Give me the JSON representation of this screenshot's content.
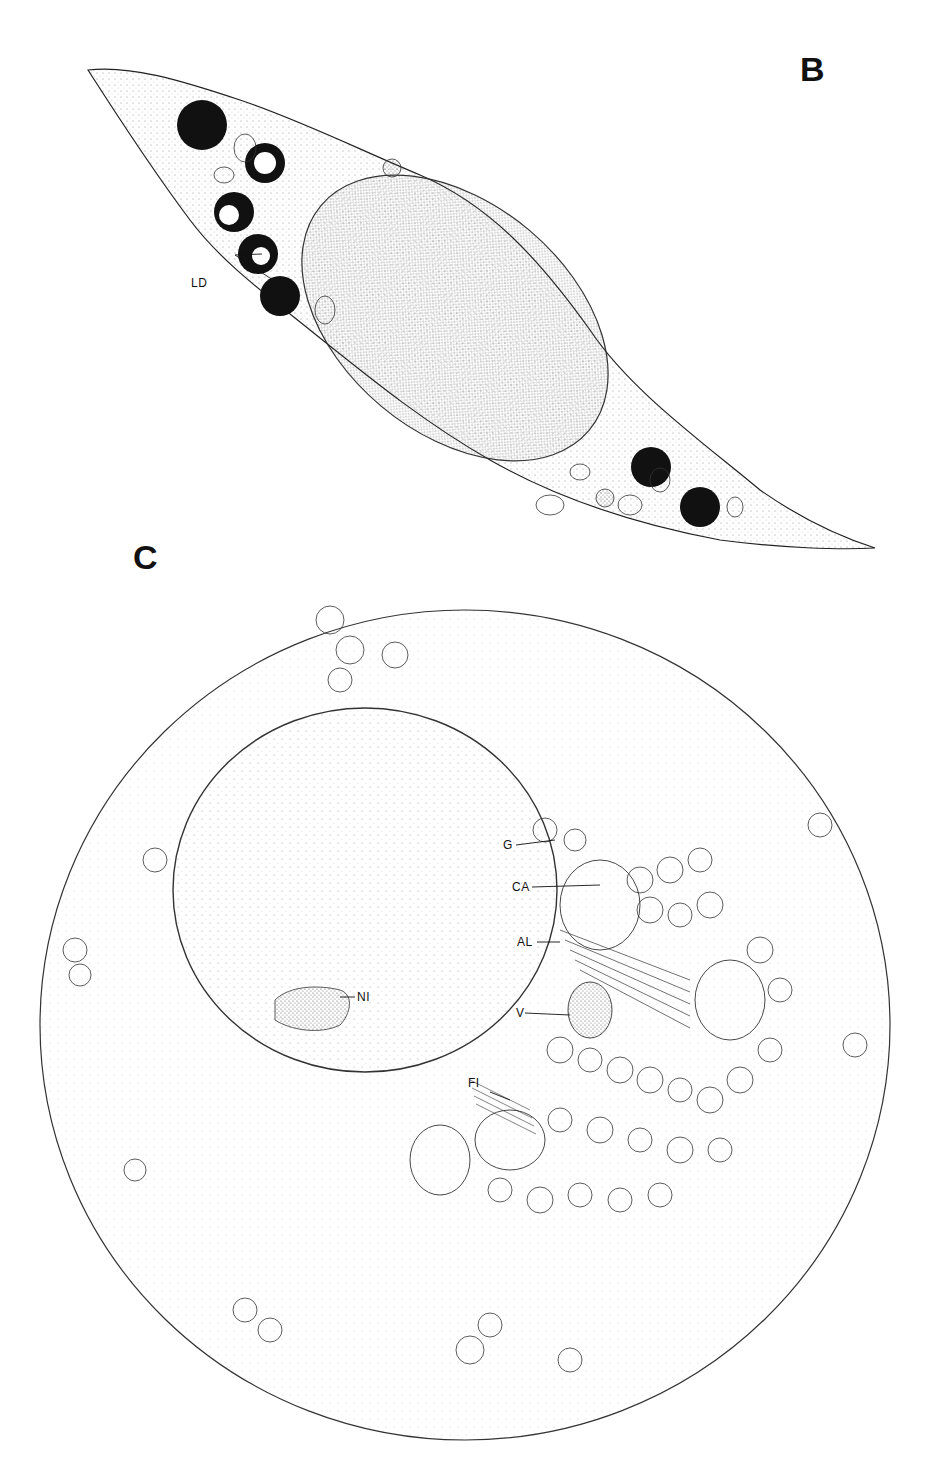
{
  "figure": {
    "panels": [
      {
        "id": "B",
        "letter": "B",
        "description": "Spindle-shaped cell with elongated nucleus and lipid droplets",
        "labels": [
          {
            "text": "LD",
            "meaning": "lipid droplets"
          }
        ]
      },
      {
        "id": "C",
        "letter": "C",
        "description": "Round cell with large nucleus and perinuclear organelle cluster",
        "labels": [
          {
            "text": "G",
            "meaning": "Golgi"
          },
          {
            "text": "CA",
            "meaning": "cytoplasmic aggregate"
          },
          {
            "text": "AL",
            "meaning": "annulate lamellae"
          },
          {
            "text": "V",
            "meaning": "vesicles"
          },
          {
            "text": "NI",
            "meaning": "nucleolus"
          },
          {
            "text": "FI",
            "meaning": "filaments"
          }
        ]
      }
    ]
  },
  "colors": {
    "ink": "#111111",
    "background": "#ffffff",
    "stipple": "#555555"
  }
}
